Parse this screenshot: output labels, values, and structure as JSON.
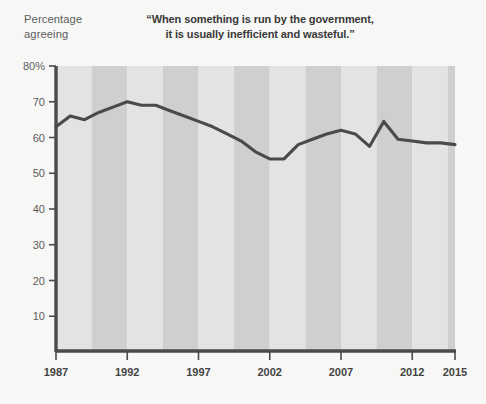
{
  "chart_data": {
    "type": "line",
    "title": "“When something is run by the government, it is usually inefficient and wasteful.”",
    "title_line1": "“When something is run by the government,",
    "title_line2": "it is usually inefficient and wasteful.”",
    "ylabel": "Percentage agreeing",
    "ylabel_line1": "Percentage",
    "ylabel_line2": "agreeing",
    "xlabel": "",
    "ylim": [
      0,
      80
    ],
    "xlim": [
      1987,
      2015
    ],
    "ytick_labels": [
      "80%",
      "70",
      "60",
      "50",
      "40",
      "30",
      "20",
      "10"
    ],
    "ytick_values": [
      80,
      70,
      60,
      50,
      40,
      30,
      20,
      10
    ],
    "xtick_labels": [
      "1987",
      "1992",
      "1997",
      "2002",
      "2007",
      "2012",
      "2015"
    ],
    "xtick_values": [
      1987,
      1992,
      1997,
      2002,
      2007,
      2012,
      2015
    ],
    "grid": false,
    "legend": "none",
    "series": [
      {
        "name": "Percentage agreeing",
        "color": "#4a4a4a",
        "x": [
          1987,
          1988,
          1989,
          1990,
          1991,
          1992,
          1993,
          1994,
          1995,
          1996,
          1997,
          1998,
          1999,
          2000,
          2001,
          2002,
          2003,
          2004,
          2005,
          2006,
          2007,
          2008,
          2009,
          2010,
          2011,
          2012,
          2013,
          2014,
          2015
        ],
        "values": [
          63,
          66,
          65,
          67,
          68.5,
          70,
          69,
          69,
          67.5,
          66,
          64.5,
          63,
          61,
          59,
          56,
          54,
          54,
          58,
          59.5,
          61,
          62,
          61,
          57.5,
          64.5,
          59.5,
          59,
          58.5,
          58.5,
          58
        ]
      }
    ],
    "band_shading": {
      "light": "#e3e3e3",
      "dark": "#cfcfcf",
      "band_width_years": 2.5
    },
    "axis_color": "#4a4a4a",
    "background": "#f7f7f5"
  }
}
